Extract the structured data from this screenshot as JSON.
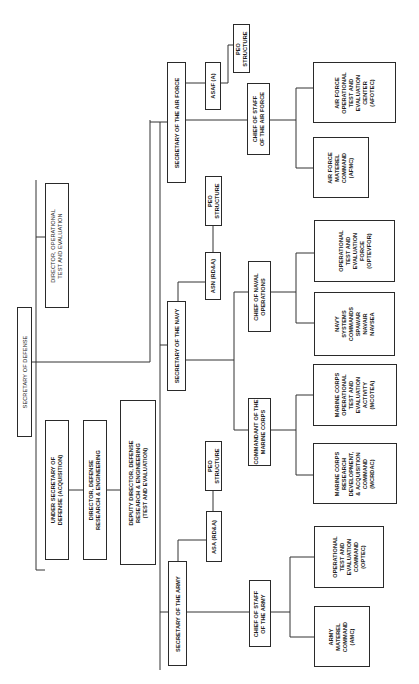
{
  "diagram": {
    "type": "org-chart",
    "orientation": "rotated-90-ccw",
    "nodes": {
      "secdef": "SECRETARY OF DEFENSE",
      "usd_a": "UNDER SECRETARY OF\nDEFENSE (ACQUISITION)",
      "ddre": "DIRECTOR, DEFENSE\nRESEARCH & ENGINEERING",
      "dep_ddre": "DEPUTY DIRECTOR, DEFENSE\nRESEARCH & ENGINEERING\n(TEST AND EVALUATION)",
      "dote": "DIRECTOR, OPERATIONAL\nTEST AND EVALUATION",
      "secaf": "SECRETARY OF THE AIR FORCE",
      "asaf": "ASAF (A)",
      "peo_af": "PEO\nSTRUCTURE",
      "csaf": "CHIEF OF STAFF\nOF THE AIR FORCE",
      "afotec": "AIR FORCE\nOPERATIONAL\nTEST AND\nEVALUATION\nCENTER\n(AFOTEC)",
      "afmc": "AIR FORCE\nMATEREL\nCOMMAND\n(AFMC)",
      "secnav": "SECRETARY OF THE NAVY",
      "asn": "ASN (RD&A)",
      "peo_navy": "PEO\nSTRUCTURE",
      "cno": "CHIEF OF NAVAL\nOPERATIONS",
      "optevfor": "OPERATIONAL\nTEST AND\nEVALUATION\nFORCE\n(OPTEVFOR)",
      "navsys": "NAVY\nSYSTEMS\nCOMMANDS\nSPAWAR\nNAVAIR\nNAVSEA",
      "cmc": "COMMANDANT OF THE\nMARINE CORPS",
      "mcotea": "MARINE CORPS\nOPERATIONAL\nTEST AND\nEVALUATION\nACTIVITY\n(MCOTEA)",
      "mcrdac": "MARINE CORPS\nRESEARCH\nDEVELOPMENT,\n& ACQUISITION\nCOMMAND\n(MCRDAC)",
      "secarmy": "SECRETARY OF THE ARMY",
      "asa": "ASA (RD&A)",
      "peo_army": "PEO\nSTRUCTURE",
      "csa": "CHIEF OF STAFF\nOF THE ARMY",
      "optec": "OPERATIONAL\nTEST AND\nEVALUATION\nCOMMAND\n(OPTEC)",
      "amc": "ARMY\nMATEREL\nCOMMAND\n(AMC)"
    }
  }
}
